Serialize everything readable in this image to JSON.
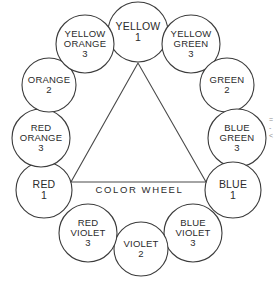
{
  "diagram": {
    "caption": "COLOR WHEEL",
    "nodes": [
      {
        "id": "yellow",
        "lines": [
          "YELLOW"
        ],
        "number": "1",
        "cx": 138,
        "cy": 32,
        "r": 30,
        "font": 10.5
      },
      {
        "id": "yellow-green",
        "lines": [
          "YELLOW",
          "GREEN"
        ],
        "number": "3",
        "cx": 191,
        "cy": 44,
        "r": 29,
        "font": 9.5
      },
      {
        "id": "green",
        "lines": [
          "GREEN"
        ],
        "number": "2",
        "cx": 227,
        "cy": 85,
        "r": 27,
        "font": 9.5
      },
      {
        "id": "blue-green",
        "lines": [
          "BLUE",
          "GREEN"
        ],
        "number": "3",
        "cx": 237,
        "cy": 138,
        "r": 29,
        "font": 9.5
      },
      {
        "id": "blue",
        "lines": [
          "BLUE"
        ],
        "number": "1",
        "cx": 233,
        "cy": 190,
        "r": 28,
        "font": 10.5
      },
      {
        "id": "blue-violet",
        "lines": [
          "BLUE",
          "VIOLET"
        ],
        "number": "3",
        "cx": 193,
        "cy": 233,
        "r": 29,
        "font": 9.5
      },
      {
        "id": "violet",
        "lines": [
          "VIOLET"
        ],
        "number": "2",
        "cx": 141,
        "cy": 249,
        "r": 27,
        "font": 9.5
      },
      {
        "id": "red-violet",
        "lines": [
          "RED",
          "VIOLET"
        ],
        "number": "3",
        "cx": 88,
        "cy": 233,
        "r": 29,
        "font": 9.5
      },
      {
        "id": "red",
        "lines": [
          "RED"
        ],
        "number": "1",
        "cx": 44,
        "cy": 190,
        "r": 28,
        "font": 10.5
      },
      {
        "id": "red-orange",
        "lines": [
          "RED",
          "ORANGE"
        ],
        "number": "3",
        "cx": 41,
        "cy": 138,
        "r": 29,
        "font": 9.5
      },
      {
        "id": "orange",
        "lines": [
          "ORANGE"
        ],
        "number": "2",
        "cx": 49,
        "cy": 85,
        "r": 27,
        "font": 9.5
      },
      {
        "id": "yellow-orange",
        "lines": [
          "YELLOW",
          "ORANGE"
        ],
        "number": "3",
        "cx": 85,
        "cy": 44,
        "r": 29,
        "font": 9.5
      }
    ],
    "triangle": {
      "apex_yellow": {
        "x": 138,
        "y": 63
      },
      "vertex_red": {
        "x": 71,
        "y": 182
      },
      "vertex_blue": {
        "x": 206,
        "y": 182
      }
    },
    "edge_marks": [
      "=",
      "-",
      "<"
    ]
  }
}
